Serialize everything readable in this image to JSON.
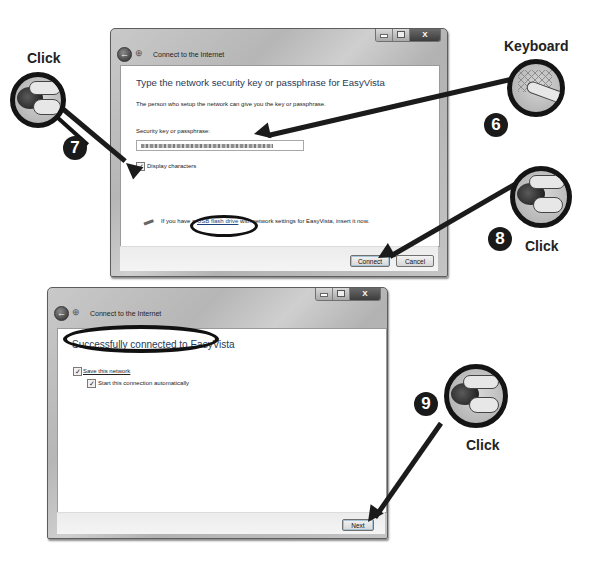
{
  "window1": {
    "title": "Connect to the Internet",
    "heading": "Type the network security key or passphrase for EasyVista",
    "description": "The person who setup the network can give you the key or passphrase.",
    "key_label": "Security key or passphrase:",
    "key_value": "",
    "display_characters": {
      "label": "Display characters",
      "checked": true
    },
    "usb_text_prefix": "If you have a ",
    "usb_link": "USB flash drive",
    "usb_text_suffix": " with network settings for EasyVista, insert it now.",
    "buttons": {
      "connect": "Connect",
      "cancel": "Cancel"
    },
    "caption": {
      "close": "X"
    }
  },
  "window2": {
    "title": "Connect to the Internet",
    "heading": "Successfully connected to EasyVista",
    "save_network": {
      "label": "Save this network",
      "checked": true
    },
    "start_auto": {
      "label": "Start this connection automatically",
      "checked": true
    },
    "buttons": {
      "next": "Next"
    },
    "caption": {
      "close": "X"
    }
  },
  "callouts": [
    {
      "step": "6",
      "label": "Keyboard",
      "icon": "keyboard-icon"
    },
    {
      "step": "7",
      "label": "Click",
      "icon": "mouse-click-icon"
    },
    {
      "step": "8",
      "label": "Click",
      "icon": "mouse-click-icon"
    },
    {
      "step": "9",
      "label": "Click",
      "icon": "mouse-click-icon"
    }
  ],
  "icons": {
    "back": "←",
    "check": "✓",
    "network": "⊕",
    "usb": "▬"
  }
}
